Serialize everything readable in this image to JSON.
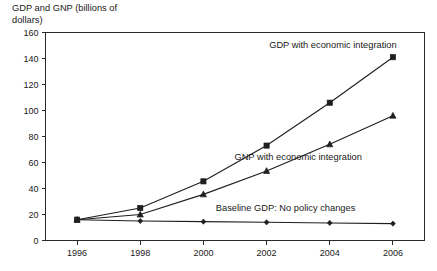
{
  "chart_data": {
    "type": "line",
    "title": "GDP and GNP (billions of dollars)",
    "title_line1": "GDP and GNP (billions of",
    "title_line2": "dollars)",
    "xlabel": "",
    "ylabel": "GDP and GNP (billions of dollars)",
    "x": [
      1996,
      1998,
      2000,
      2002,
      2004,
      2006
    ],
    "categories": [
      "1996",
      "1998",
      "2000",
      "2002",
      "2004",
      "2006"
    ],
    "xlim": [
      1995,
      2007
    ],
    "ylim": [
      0,
      160
    ],
    "yticks": [
      0,
      20,
      40,
      60,
      80,
      100,
      120,
      140,
      160
    ],
    "ytick_labels": [
      "0",
      "20",
      "40",
      "60",
      "80",
      "100",
      "120",
      "140",
      "160"
    ],
    "xtick_labels": [
      "1996",
      "1998",
      "2000",
      "2002",
      "2004",
      "2006"
    ],
    "grid": false,
    "legend_position": "inline-annotations",
    "series": [
      {
        "name": "GDP with economic integration",
        "marker": "square",
        "color": "#1f1f1f",
        "values": [
          16,
          25,
          45.5,
          73,
          106,
          141
        ],
        "label_text": "GDP with economic integration"
      },
      {
        "name": "GNP with economic integration",
        "marker": "triangle",
        "color": "#1f1f1f",
        "values": [
          16,
          20,
          35.5,
          53.5,
          74,
          96
        ],
        "label_text": "GNP with economic integration"
      },
      {
        "name": "Baseline GDP: No policy changes",
        "marker": "diamond",
        "color": "#1f1f1f",
        "values": [
          16,
          15,
          14.5,
          14,
          13.5,
          13
        ],
        "label_text": "Baseline GDP: No policy changes"
      }
    ],
    "annotations": [
      {
        "text": "GDP with economic integration",
        "x": 2004.1,
        "y": 148
      },
      {
        "text": "GNP with economic integration",
        "x": 2003.0,
        "y": 62
      },
      {
        "text": "Baseline GDP: No policy changes",
        "x": 2002.6,
        "y": 23
      }
    ]
  }
}
